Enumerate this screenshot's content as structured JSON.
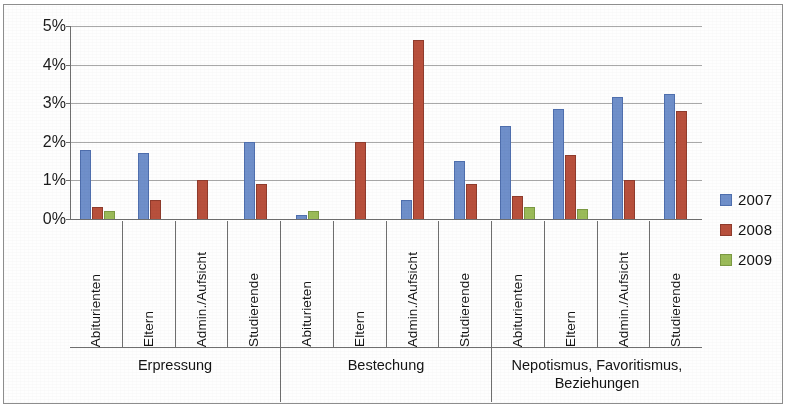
{
  "chart_data": {
    "type": "bar",
    "title": "",
    "xlabel": "",
    "ylabel": "",
    "ylim": [
      0,
      5
    ],
    "ytick_labels": [
      "0%",
      "1%",
      "2%",
      "3%",
      "4%",
      "5%"
    ],
    "ytick_values": [
      0,
      1,
      2,
      3,
      4,
      5
    ],
    "grid": true,
    "legend_position": "right",
    "value_unit": "%",
    "groups": [
      {
        "label": "Erpressung",
        "categories": [
          "Abiturienten",
          "Eltern",
          "Admin./Aufsicht",
          "Studierende"
        ]
      },
      {
        "label": "Bestechung",
        "categories": [
          "Abiturieten",
          "Eltern",
          "Admin./Aufsicht",
          "Studierende"
        ]
      },
      {
        "label": "Nepotismus, Favoritismus, Beziehungen",
        "categories": [
          "Abiturienten",
          "Eltern",
          "Admin./Aufsicht",
          "Studierende"
        ]
      }
    ],
    "categories": [
      "Abiturienten",
      "Eltern",
      "Admin./Aufsicht",
      "Studierende",
      "Abiturieten",
      "Eltern",
      "Admin./Aufsicht",
      "Studierende",
      "Abiturienten",
      "Eltern",
      "Admin./Aufsicht",
      "Studierende"
    ],
    "series": [
      {
        "name": "2007",
        "color": "#6F8FCA",
        "values": [
          1.8,
          1.7,
          0,
          2.0,
          0.1,
          0,
          0.5,
          1.5,
          2.4,
          2.85,
          3.15,
          3.25
        ]
      },
      {
        "name": "2008",
        "color": "#B8503C",
        "values": [
          0.3,
          0.5,
          1.0,
          0.9,
          0,
          2.0,
          4.65,
          0.9,
          0.6,
          1.65,
          1.0,
          2.8
        ]
      },
      {
        "name": "2009",
        "color": "#9BBB59",
        "values": [
          0.2,
          0,
          0,
          0,
          0.2,
          0,
          0,
          0,
          0.3,
          0.25,
          0,
          0
        ]
      }
    ]
  },
  "legend": {
    "items": [
      {
        "label": "2007",
        "swatch": "series-2007-swatch"
      },
      {
        "label": "2008",
        "swatch": "series-2008-swatch"
      },
      {
        "label": "2009",
        "swatch": "series-2009-swatch"
      }
    ]
  }
}
